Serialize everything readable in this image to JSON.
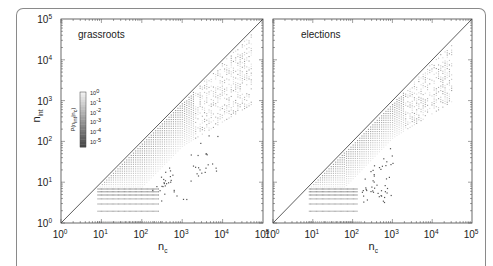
{
  "chart_data": [
    {
      "type": "heatmap",
      "title": "grassroots",
      "xlabel": "n_c",
      "ylabel": "n_int",
      "xscale": "log",
      "yscale": "log",
      "xlim": [
        1,
        100000
      ],
      "ylim": [
        1,
        100000
      ],
      "x_ticks": [
        "10^0",
        "10^1",
        "10^2",
        "10^3",
        "10^4",
        "10^5"
      ],
      "y_ticks": [
        "10^0",
        "10^1",
        "10^2",
        "10^3",
        "10^4",
        "10^5"
      ],
      "reference_line": "n_int = n_c (diagonal)",
      "colorbar": {
        "label": "P(n_int|n_c)",
        "ticks": [
          "10^0",
          "10^-1",
          "10^-2",
          "10^-3",
          "10^-4",
          "10^-5"
        ],
        "position": "upper-left inside plot"
      },
      "density_extent": {
        "nc_max_log": 4.7,
        "band_width_log": 1.1,
        "low_rows_nc_max_log": 2.4,
        "outlier_nc_max_log": 3.9
      }
    },
    {
      "type": "heatmap",
      "title": "elections",
      "xlabel": "n_c",
      "ylabel": "",
      "xscale": "log",
      "yscale": "log",
      "xlim": [
        1,
        100000
      ],
      "ylim": [
        1,
        100000
      ],
      "x_ticks": [
        "10^0",
        "10^1",
        "10^2",
        "10^3",
        "10^4",
        "10^5"
      ],
      "y_ticks": [],
      "reference_line": "n_int = n_c (diagonal)",
      "density_extent": {
        "nc_max_log": 4.5,
        "band_width_log": 0.9,
        "low_rows_nc_max_log": 2.1,
        "outlier_nc_max_log": 3.0
      }
    }
  ],
  "panels": [
    {
      "title": "grassroots",
      "xlabel_main": "n",
      "xlabel_sub": "c",
      "ylabel_main": "n",
      "ylabel_sub": "int"
    },
    {
      "title": "elections",
      "xlabel_main": "n",
      "xlabel_sub": "c"
    }
  ],
  "ticks": [
    {
      "base": "10",
      "exp": "0"
    },
    {
      "base": "10",
      "exp": "1"
    },
    {
      "base": "10",
      "exp": "2"
    },
    {
      "base": "10",
      "exp": "3"
    },
    {
      "base": "10",
      "exp": "4"
    },
    {
      "base": "10",
      "exp": "5"
    }
  ],
  "colorbar": {
    "label": "P(n",
    "label_sub": "int",
    "label_end": "|n",
    "label_sub2": "c",
    "label_close": ")",
    "ticks": [
      {
        "base": "10",
        "exp": "0"
      },
      {
        "base": "10",
        "exp": "-1"
      },
      {
        "base": "10",
        "exp": "-2"
      },
      {
        "base": "10",
        "exp": "-3"
      },
      {
        "base": "10",
        "exp": "-4"
      },
      {
        "base": "10",
        "exp": "-5"
      }
    ]
  }
}
